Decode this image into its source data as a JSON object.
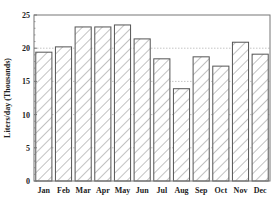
{
  "chart_data": {
    "type": "bar",
    "title": "",
    "xlabel": "",
    "ylabel": "Liters/day (Thousands)",
    "categories": [
      "Jan",
      "Feb",
      "Mar",
      "Apr",
      "May",
      "Jun",
      "Jul",
      "Aug",
      "Sep",
      "Oct",
      "Nov",
      "Dec"
    ],
    "values": [
      19.4,
      20.2,
      23.2,
      23.2,
      23.5,
      21.4,
      18.4,
      13.9,
      18.7,
      17.3,
      20.9,
      19.1
    ],
    "ylim": [
      0,
      25
    ],
    "yticks": [
      0,
      5,
      10,
      15,
      20,
      25
    ],
    "grid": "dotted horizontal at 5-unit intervals (visible between bars)",
    "legend": null,
    "bar_fill": "diagonal hatch",
    "colors": {
      "bar_stroke": "#555555",
      "hatch": "#777777",
      "axis": "#777777",
      "grid": "#aaaaaa",
      "text": "#222222"
    }
  }
}
